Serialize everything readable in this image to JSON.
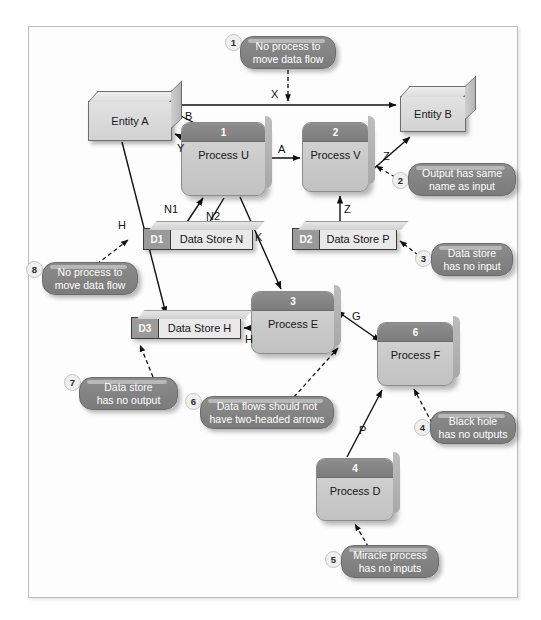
{
  "diagram": {
    "border_color": "#b9bcc0",
    "background": "#ffffff",
    "callout_color": "#7b7b7b",
    "process_header_color": "#7c7c7c"
  },
  "entities": [
    {
      "id": "entity-a",
      "label": "Entity A"
    },
    {
      "id": "entity-b",
      "label": "Entity B"
    }
  ],
  "processes": [
    {
      "id": "process-u",
      "number": "1",
      "label": "Process U"
    },
    {
      "id": "process-v",
      "number": "2",
      "label": "Process V"
    },
    {
      "id": "process-e",
      "number": "3",
      "label": "Process E"
    },
    {
      "id": "process-d",
      "number": "4",
      "label": "Process D"
    },
    {
      "id": "process-f",
      "number": "6",
      "label": "Process F"
    }
  ],
  "datastores": [
    {
      "id": "store-n",
      "code": "D1",
      "label": "Data Store N"
    },
    {
      "id": "store-p",
      "code": "D2",
      "label": "Data Store P"
    },
    {
      "id": "store-h",
      "code": "D3",
      "label": "Data Store H"
    }
  ],
  "flow_labels": [
    {
      "id": "flow-x",
      "label": "X"
    },
    {
      "id": "flow-b",
      "label": "B"
    },
    {
      "id": "flow-y",
      "label": "Y"
    },
    {
      "id": "flow-a",
      "label": "A"
    },
    {
      "id": "flow-z-out",
      "label": "Z"
    },
    {
      "id": "flow-z-in",
      "label": "Z"
    },
    {
      "id": "flow-h-left",
      "label": "H"
    },
    {
      "id": "flow-n1",
      "label": "N1"
    },
    {
      "id": "flow-n2",
      "label": "N2"
    },
    {
      "id": "flow-k",
      "label": "K"
    },
    {
      "id": "flow-h-right",
      "label": "H"
    },
    {
      "id": "flow-g",
      "label": "G"
    },
    {
      "id": "flow-p",
      "label": "P"
    }
  ],
  "callouts": [
    {
      "id": "callout-1",
      "number": "1",
      "line1": "No process to",
      "line2": "move data flow"
    },
    {
      "id": "callout-2",
      "number": "2",
      "line1": "Output has same",
      "line2": "name as input"
    },
    {
      "id": "callout-3",
      "number": "3",
      "line1": "Data store",
      "line2": "has no input"
    },
    {
      "id": "callout-4",
      "number": "4",
      "line1": "Black hole",
      "line2": "has no outputs"
    },
    {
      "id": "callout-5",
      "number": "5",
      "line1": "Miracle process",
      "line2": "has no inputs"
    },
    {
      "id": "callout-6",
      "number": "6",
      "line1": "Data flows should not",
      "line2": "have two-headed arrows"
    },
    {
      "id": "callout-7",
      "number": "7",
      "line1": "Data store",
      "line2": "has no output"
    },
    {
      "id": "callout-8",
      "number": "8",
      "line1": "No process to",
      "line2": "move data flow"
    }
  ]
}
